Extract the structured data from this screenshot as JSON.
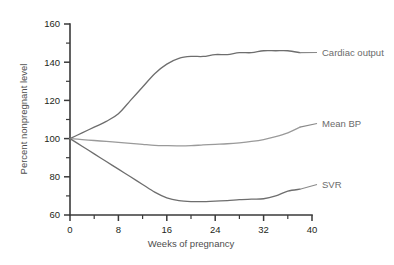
{
  "chart_data": {
    "type": "line",
    "title": "",
    "xlabel": "Weeks of pregnancy",
    "ylabel": "Percent nonpregnant level",
    "xlim": [
      0,
      40
    ],
    "ylim": [
      60,
      160
    ],
    "x_ticks": [
      0,
      8,
      16,
      24,
      32,
      40
    ],
    "x_tick_labels": [
      "0",
      "8",
      "16",
      "24",
      "32",
      "40"
    ],
    "x_minor_ticks": [
      4,
      12,
      20,
      28,
      36
    ],
    "y_ticks": [
      60,
      80,
      100,
      120,
      140,
      160
    ],
    "y_tick_labels": [
      "60",
      "80",
      "100",
      "120",
      "140",
      "160"
    ],
    "y_minor_ticks": [
      70,
      90,
      110,
      130,
      150
    ],
    "grid": false,
    "legend_position": "right-inline-labels",
    "series": [
      {
        "name": "Cardiac output",
        "color": "#6e6e6e",
        "label_x": 40,
        "label_y": 143,
        "x": [
          0,
          2,
          4,
          6,
          8,
          10,
          12,
          14,
          16,
          18,
          20,
          22,
          24,
          26,
          28,
          30,
          32,
          34,
          36,
          38
        ],
        "values": [
          100,
          103,
          106,
          109,
          113,
          120,
          127,
          134,
          139,
          142,
          143,
          143,
          144,
          144,
          145,
          145,
          146,
          146,
          146,
          145
        ]
      },
      {
        "name": "Mean BP",
        "color": "#9a9a9a",
        "label_x": 40,
        "label_y": 105,
        "x": [
          0,
          2,
          4,
          6,
          8,
          10,
          12,
          14,
          16,
          18,
          20,
          22,
          24,
          26,
          28,
          30,
          32,
          34,
          36,
          38
        ],
        "values": [
          100,
          99.5,
          99,
          98.5,
          98,
          97.5,
          97,
          96.5,
          96.3,
          96.2,
          96.3,
          96.7,
          97,
          97.3,
          97.8,
          98.5,
          99.5,
          101,
          103,
          106
        ]
      },
      {
        "name": "SVR",
        "color": "#6e6e6e",
        "label_x": 40,
        "label_y": 73,
        "x": [
          0,
          2,
          4,
          6,
          8,
          10,
          12,
          14,
          16,
          18,
          20,
          22,
          24,
          26,
          28,
          30,
          32,
          34,
          36,
          38
        ],
        "values": [
          100,
          96,
          92,
          88,
          84,
          80,
          76,
          72,
          69,
          67.5,
          67,
          67,
          67.3,
          67.5,
          68,
          68.3,
          68.5,
          70,
          72.5,
          73.5
        ]
      }
    ]
  },
  "axes": {
    "x_axis_title": "Weeks of pregnancy",
    "y_axis_title": "Percent nonpregnant level"
  },
  "labels": {
    "cardiac_output": "Cardiac output",
    "mean_bp": "Mean BP",
    "svr": "SVR"
  }
}
